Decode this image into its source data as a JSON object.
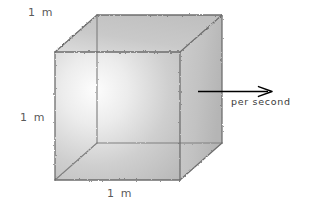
{
  "figure": {
    "background_color": "#ffffff",
    "labels": {
      "top_edge": "1 m",
      "left_edge": "1 m",
      "bottom_edge": "1 m",
      "flow_rate": "per second"
    },
    "cube": {
      "style": "wavy-hand-drawn-wireframe",
      "edge_color": "#6e6e6e",
      "fill_light": "#f2f2f2",
      "fill_mid": "#cfcfcf",
      "fill_dark": "#b4b4b4",
      "front_face_top_left_px": [
        55,
        52
      ],
      "front_face_size_px": 128,
      "depth_offset_px": [
        42,
        -37
      ]
    },
    "arrow": {
      "color": "#000000",
      "direction": "right",
      "start_px": [
        198,
        92
      ],
      "end_px": [
        272,
        92
      ]
    }
  }
}
